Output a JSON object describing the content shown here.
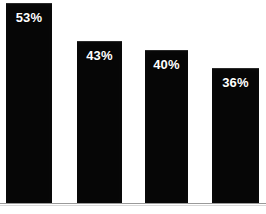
{
  "chart_data": {
    "type": "bar",
    "title": "",
    "subtitle": "",
    "xlabel": "",
    "ylabel": "",
    "categories": [
      "",
      "",
      "",
      ""
    ],
    "values": [
      53,
      43,
      40,
      36
    ],
    "data_labels": [
      "53%",
      "43%",
      "40%",
      "36%"
    ],
    "ylim": [
      0,
      57
    ],
    "grid": false,
    "legend": false,
    "legend_position": "none",
    "series": [
      {
        "name": "",
        "values": [
          53,
          43,
          40,
          36
        ]
      }
    ],
    "colors": {
      "bar_fill": "#060606",
      "bar_top_edge": "#2a2a2a",
      "label_text": "#ffffff",
      "background": "#ffffff",
      "axis_line": "#9a9a9a",
      "axis_line_soft": "#d8d8d8"
    },
    "bars": [
      {
        "label": "53%",
        "value": 53,
        "x": 6,
        "width": 46,
        "top": 3,
        "label_top": 10
      },
      {
        "label": "43%",
        "value": 43,
        "x": 77,
        "width": 45,
        "top": 41,
        "label_top": 48
      },
      {
        "label": "40%",
        "value": 40,
        "x": 145,
        "width": 43,
        "top": 50,
        "label_top": 57
      },
      {
        "label": "36%",
        "value": 36,
        "x": 212,
        "width": 47,
        "top": 68,
        "label_top": 75
      }
    ],
    "axis": {
      "baseline_y": 203,
      "baseline_soft_y": 205
    }
  }
}
